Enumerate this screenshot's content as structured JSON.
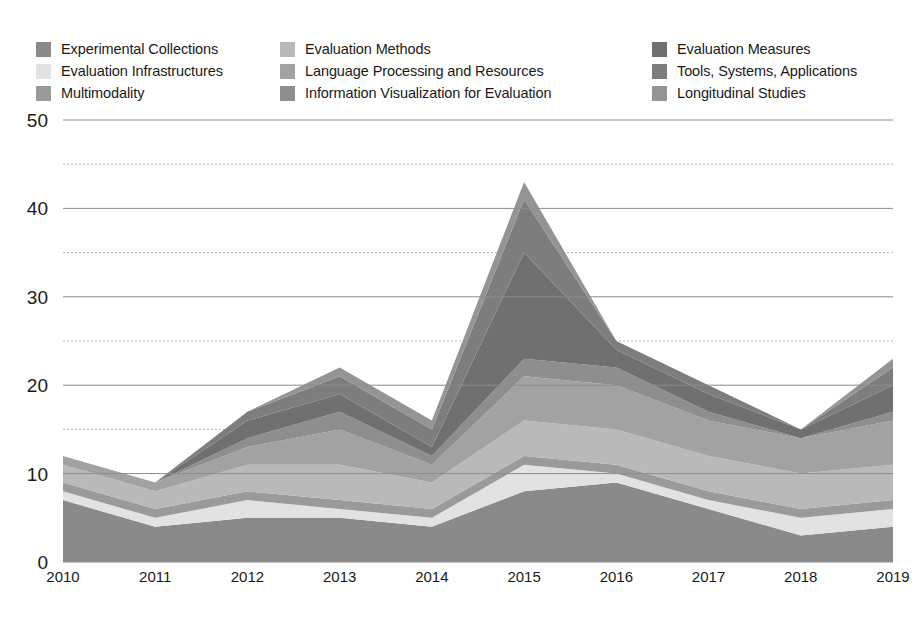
{
  "legend": {
    "columns": [
      {
        "items": [
          {
            "label": "Experimental Collections",
            "color": "#8a8a8a"
          },
          {
            "label": "Evaluation Infrastructures",
            "color": "#e2e2e2"
          },
          {
            "label": "Multimodality",
            "color": "#9a9a9a"
          }
        ]
      },
      {
        "items": [
          {
            "label": "Evaluation Methods",
            "color": "#b9b9b9"
          },
          {
            "label": "Language Processing and Resources",
            "color": "#a2a2a2"
          },
          {
            "label": "Information Visualization for Evaluation",
            "color": "#8e8e8e"
          }
        ]
      },
      {
        "items": [
          {
            "label": "Evaluation Measures",
            "color": "#707070"
          },
          {
            "label": "Tools, Systems, Applications",
            "color": "#7d7d7d"
          },
          {
            "label": "Longitudinal Studies",
            "color": "#949494"
          }
        ]
      }
    ]
  },
  "axes": {
    "y_ticks": [
      "0",
      "10",
      "20",
      "30",
      "40",
      "50"
    ],
    "x_ticks": [
      "2010",
      "2011",
      "2012",
      "2013",
      "2014",
      "2015",
      "2016",
      "2017",
      "2018",
      "2019"
    ],
    "y_minor_ticks": [
      5,
      15,
      25,
      35,
      45
    ],
    "gridline_color": "#8c8c8c",
    "minor_gridline_color": "#b5b5b5"
  },
  "chart_data": {
    "type": "area",
    "stacked": true,
    "title": "",
    "xlabel": "",
    "ylabel": "",
    "ylim": [
      0,
      50
    ],
    "grid": true,
    "legend_position": "top",
    "categories": [
      "2010",
      "2011",
      "2012",
      "2013",
      "2014",
      "2015",
      "2016",
      "2017",
      "2018",
      "2019"
    ],
    "series": [
      {
        "name": "Experimental Collections",
        "color": "#8a8a8a",
        "values": [
          7,
          4,
          5,
          5,
          4,
          8,
          9,
          6,
          3,
          4
        ]
      },
      {
        "name": "Evaluation Infrastructures",
        "color": "#e2e2e2",
        "values": [
          1,
          1,
          2,
          1,
          1,
          3,
          1,
          1,
          2,
          2
        ]
      },
      {
        "name": "Multimodality",
        "color": "#9a9a9a",
        "values": [
          1,
          1,
          1,
          1,
          1,
          1,
          1,
          1,
          1,
          1
        ]
      },
      {
        "name": "Evaluation Methods",
        "color": "#b9b9b9",
        "values": [
          2,
          2,
          3,
          4,
          3,
          4,
          4,
          4,
          4,
          4
        ]
      },
      {
        "name": "Language Processing and Resources",
        "color": "#a2a2a2",
        "values": [
          1,
          1,
          2,
          4,
          2,
          5,
          5,
          4,
          4,
          5
        ]
      },
      {
        "name": "Information Visualization for Evaluation",
        "color": "#8e8e8e",
        "values": [
          0,
          0,
          1,
          2,
          1,
          2,
          2,
          1,
          0,
          1
        ]
      },
      {
        "name": "Evaluation Measures",
        "color": "#707070",
        "values": [
          0,
          0,
          2,
          2,
          1,
          12,
          2,
          2,
          1,
          3
        ]
      },
      {
        "name": "Tools, Systems, Applications",
        "color": "#7d7d7d",
        "values": [
          0,
          0,
          1,
          2,
          2,
          6,
          1,
          1,
          0,
          2
        ]
      },
      {
        "name": "Longitudinal Studies",
        "color": "#949494",
        "values": [
          0,
          0,
          0,
          1,
          1,
          2,
          0,
          0,
          0,
          1
        ]
      }
    ],
    "totals": [
      12,
      9,
      17,
      22,
      16,
      43,
      25,
      20,
      15,
      23
    ]
  }
}
